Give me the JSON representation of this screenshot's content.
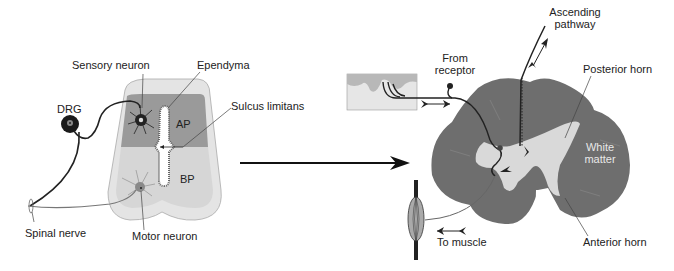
{
  "left_diagram": {
    "title": "Embryonic spinal cord (neural tube) cross-section",
    "labels": {
      "sensory_neuron": "Sensory neuron",
      "ependyma": "Ependyma",
      "drg": "DRG",
      "sulcus_limitans": "Sulcus limitans",
      "ap": "AP",
      "bp": "BP",
      "spinal_nerve": "Spinal nerve",
      "motor_neuron": "Motor neuron"
    }
  },
  "right_diagram": {
    "title": "Adult spinal cord cross-section",
    "labels": {
      "ascending_pathway_line1": "Ascending",
      "ascending_pathway_line2": "pathway",
      "from_receptor_line1": "From",
      "from_receptor_line2": "receptor",
      "posterior_horn": "Posterior horn",
      "white_matter_line1": "White",
      "white_matter_line2": "matter",
      "to_muscle": "To muscle",
      "anterior_horn": "Anterior horn"
    }
  },
  "colors": {
    "outer_tube": "#e4e4e4",
    "alar_plate": "#9a9a9a",
    "basal_plate": "#d6d6d6",
    "cord_tissue": "#6e6e6e",
    "gray_matter": "#d9d9d9",
    "skin": "#b8b8b8",
    "dermis": "#e6e6e6",
    "line": "#222222"
  }
}
